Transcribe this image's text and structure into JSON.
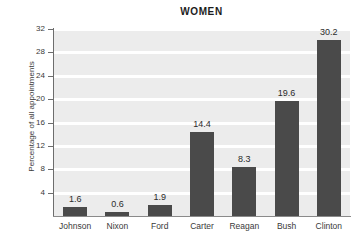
{
  "chart_data": {
    "type": "bar",
    "title": "WOMEN",
    "xlabel": "",
    "ylabel": "Percentage of all appointments",
    "categories": [
      "Johnson",
      "Nixon",
      "Ford",
      "Carter",
      "Reagan",
      "Bush",
      "Clinton"
    ],
    "values": [
      1.6,
      0.6,
      1.9,
      14.4,
      8.3,
      19.6,
      30.2
    ],
    "value_labels": [
      "1.6",
      "0.6",
      "1.9",
      "14.4",
      "8.3",
      "19.6",
      "30.2"
    ],
    "ylim": [
      0,
      32
    ],
    "yticks": [
      4,
      8,
      12,
      16,
      20,
      24,
      28,
      32
    ],
    "ytick_labels": [
      "4",
      "8",
      "12",
      "16",
      "20",
      "24",
      "28",
      "32"
    ],
    "grid": "horizontal",
    "legend": "none",
    "colors": {
      "bar": "#4a4a4a",
      "plot_background": "#ececec",
      "gridline": "#ffffff",
      "axis": "#6d6d6d",
      "text": "#3a3a3a",
      "title_text": "#1d1d1d",
      "page_background": "#ffffff"
    }
  }
}
